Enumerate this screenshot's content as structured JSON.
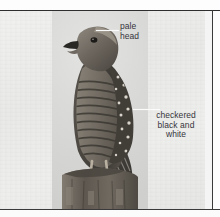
{
  "page": {
    "background_color": "#fdfdfd",
    "rule_color": "#2e2e2e"
  },
  "plate": {
    "background_color": "#ebebea",
    "caption_alt": "Black and white photograph of a hawk perched on a weathered wooden post"
  },
  "photo": {
    "subject": "hawk-perched-on-post",
    "tone": "black-and-white",
    "background_color": "#d9d9d8",
    "bird_color": "#4a4641",
    "post_color": "#6b6660"
  },
  "annotations": [
    {
      "id": "pale-head",
      "text": "pale\nhead",
      "lines": [
        "pale",
        "head"
      ],
      "align": "left",
      "leader": "white-line",
      "text_color": "#35353a"
    },
    {
      "id": "checkered",
      "text": "checkered\nblack and\nwhite",
      "lines": [
        "checkered",
        "black and",
        "white"
      ],
      "align": "center",
      "leader": "white-line",
      "text_color": "#35353a"
    }
  ]
}
